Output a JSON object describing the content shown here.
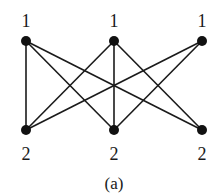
{
  "figure": {
    "caption": "(a)",
    "colors": {
      "ink": "#1a1a1a",
      "node": "#111111",
      "background": "#ffffff"
    },
    "nodes": [
      {
        "id": "t1",
        "label": "1",
        "row": "top",
        "x": 26,
        "y": 41
      },
      {
        "id": "t2",
        "label": "1",
        "row": "top",
        "x": 114,
        "y": 41
      },
      {
        "id": "t3",
        "label": "1",
        "row": "top",
        "x": 202,
        "y": 41
      },
      {
        "id": "b1",
        "label": "2",
        "row": "bottom",
        "x": 26,
        "y": 130
      },
      {
        "id": "b2",
        "label": "2",
        "row": "bottom",
        "x": 114,
        "y": 130
      },
      {
        "id": "b3",
        "label": "2",
        "row": "bottom",
        "x": 202,
        "y": 130
      }
    ],
    "edges": [
      [
        "t1",
        "b1"
      ],
      [
        "t1",
        "b2"
      ],
      [
        "t1",
        "b3"
      ],
      [
        "t2",
        "b1"
      ],
      [
        "t2",
        "b2"
      ],
      [
        "t2",
        "b3"
      ],
      [
        "t3",
        "b1"
      ],
      [
        "t3",
        "b2"
      ]
    ]
  }
}
